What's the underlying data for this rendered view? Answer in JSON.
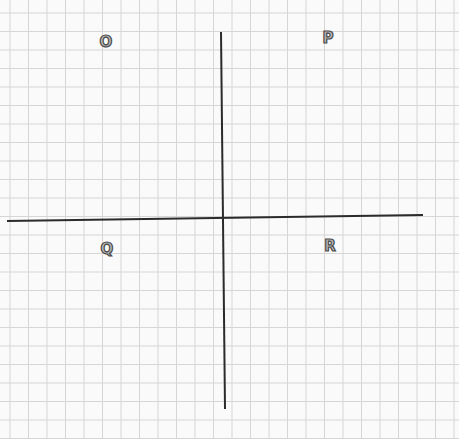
{
  "diagram": {
    "type": "coordinate-plane-quadrants",
    "background_color": "#fafafa",
    "grid": {
      "color": "#d6d6d6",
      "spacing_px": 18.5,
      "origin_x": 10,
      "origin_y": 13
    },
    "axes": {
      "color": "#2b2b2b",
      "x_axis": {
        "x1": 7,
        "y1": 221,
        "x2": 423,
        "y2": 215
      },
      "y_axis": {
        "x1": 221,
        "y1": 32,
        "x2": 225,
        "y2": 409
      }
    },
    "quadrants": [
      {
        "label": "O",
        "position": "top-left",
        "x": 106,
        "y": 42
      },
      {
        "label": "P",
        "position": "top-right",
        "x": 328,
        "y": 38
      },
      {
        "label": "Q",
        "position": "bottom-left",
        "x": 107,
        "y": 249
      },
      {
        "label": "R",
        "position": "bottom-right",
        "x": 330,
        "y": 246
      }
    ]
  }
}
